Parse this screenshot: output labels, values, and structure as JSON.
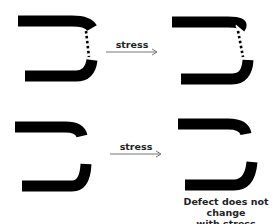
{
  "diagram": {
    "rows": [
      {
        "id": "row-1",
        "arrow_label": "stress",
        "defect": "dotted-connection"
      },
      {
        "id": "row-2",
        "arrow_label": "stress",
        "defect": "gap"
      }
    ],
    "caption_line1": "Defect does not change",
    "caption_line2": "with stress",
    "colors": {
      "shape": "#000000",
      "arrow": "#777777",
      "text": "#222222"
    }
  }
}
